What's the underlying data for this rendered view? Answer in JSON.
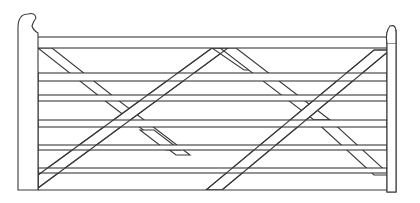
{
  "figure": {
    "stroke_color": "#3a3a3a",
    "background": "#ffffff"
  }
}
